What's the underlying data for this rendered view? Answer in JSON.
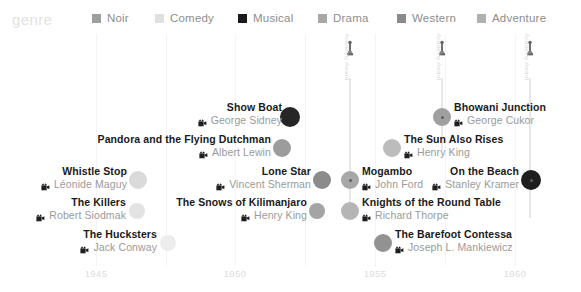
{
  "legend": {
    "title": "genre",
    "items": [
      {
        "label": "Noir",
        "color": "#9e9e9e",
        "x": 92
      },
      {
        "label": "Comedy",
        "color": "#e0e0e0",
        "x": 155
      },
      {
        "label": "Musical",
        "color": "#1a1a1a",
        "x": 238
      },
      {
        "label": "Drama",
        "color": "#a8a8a8",
        "x": 318
      },
      {
        "label": "Western",
        "color": "#8a8a8a",
        "x": 397
      },
      {
        "label": "Adventure",
        "color": "#b0b0b0",
        "x": 477
      }
    ]
  },
  "axis": {
    "ticks": [
      {
        "label": "1945",
        "x": 96
      },
      {
        "label": "1950",
        "x": 235
      },
      {
        "label": "1955",
        "x": 375
      },
      {
        "label": "1960",
        "x": 515
      }
    ],
    "gridlines": [
      96,
      235,
      375,
      515,
      166,
      305,
      445
    ],
    "range": [
      1943,
      1960.5
    ]
  },
  "oscars": [
    {
      "name": "oscar-1953",
      "x": 350,
      "label": "Academy Award",
      "stem_height": 130
    },
    {
      "name": "oscar-1955",
      "x": 442,
      "label": "Academy Award",
      "stem_height": 72
    },
    {
      "name": "oscar-1959",
      "x": 530,
      "label": "Academy Award",
      "stem_height": 140
    }
  ],
  "chart_data": {
    "type": "scatter",
    "title": "",
    "xlabel": "",
    "ylabel": "",
    "xlim": [
      1943,
      1960.5
    ],
    "grid": true,
    "legend_position": "top",
    "legend_title": "genre",
    "categories": [
      "Noir",
      "Comedy",
      "Musical",
      "Drama",
      "Western",
      "Adventure"
    ],
    "points": [
      {
        "title": "Show Boat",
        "director": "George Sidney",
        "genre": "Musical",
        "color": "#262626",
        "x": 290,
        "y": 117,
        "r": 10,
        "align": "right",
        "label_x": 282,
        "label_y": 101,
        "oscar": false
      },
      {
        "title": "Pandora and the Flying Dutchman",
        "director": "Albert Lewin",
        "genre": "Drama",
        "color": "#9c9c9c",
        "x": 282,
        "y": 148,
        "r": 9,
        "align": "right",
        "label_x": 271,
        "label_y": 133,
        "oscar": false
      },
      {
        "title": "Whistle Stop",
        "director": "Léonide Maguy",
        "genre": "Comedy",
        "color": "#dadada",
        "x": 138,
        "y": 180,
        "r": 9,
        "align": "right",
        "label_x": 127,
        "label_y": 165,
        "oscar": false
      },
      {
        "title": "The Killers",
        "director": "Robert Siodmak",
        "genre": "Noir",
        "color": "#e3e3e3",
        "x": 137,
        "y": 211,
        "r": 8,
        "align": "right",
        "label_x": 126,
        "label_y": 196,
        "oscar": false
      },
      {
        "title": "The Hucksters",
        "director": "Jack Conway",
        "genre": "Comedy",
        "color": "#ededed",
        "x": 168,
        "y": 243,
        "r": 8,
        "align": "right",
        "label_x": 157,
        "label_y": 228,
        "oscar": false
      },
      {
        "title": "The Snows of Kilimanjaro",
        "director": "Henry King",
        "genre": "Adventure",
        "color": "#a4a4a4",
        "x": 317,
        "y": 211,
        "r": 8,
        "align": "right",
        "label_x": 307,
        "label_y": 196,
        "oscar": false
      },
      {
        "title": "Lone Star",
        "director": "Vincent Sherman",
        "genre": "Western",
        "color": "#8b8b8b",
        "x": 322,
        "y": 180,
        "r": 9,
        "align": "right",
        "label_x": 311,
        "label_y": 165,
        "oscar": false
      },
      {
        "title": "Mogambo",
        "director": "John Ford",
        "genre": "Drama",
        "color": "#a8a8a8",
        "x": 350,
        "y": 180,
        "r": 9,
        "align": "left",
        "label_x": 362,
        "label_y": 165,
        "oscar": true
      },
      {
        "title": "Knights of the Round Table",
        "director": "Richard Thorpe",
        "genre": "Adventure",
        "color": "#b5b5b5",
        "x": 350,
        "y": 211,
        "r": 9,
        "align": "left",
        "label_x": 362,
        "label_y": 196,
        "oscar": false
      },
      {
        "title": "The Barefoot Contessa",
        "director": "Joseph L. Mankiewicz",
        "genre": "Drama",
        "color": "#929292",
        "x": 383,
        "y": 243,
        "r": 9,
        "align": "left",
        "label_x": 395,
        "label_y": 228,
        "oscar": false
      },
      {
        "title": "Bhowani Junction",
        "director": "George Cukor",
        "genre": "Drama",
        "color": "#a0a0a0",
        "x": 442,
        "y": 117,
        "r": 9,
        "align": "left",
        "label_x": 454,
        "label_y": 101,
        "oscar": true
      },
      {
        "title": "The Sun Also Rises",
        "director": "Henry King",
        "genre": "Adventure",
        "color": "#bcbcbc",
        "x": 392,
        "y": 148,
        "r": 9,
        "align": "left",
        "label_x": 404,
        "label_y": 133,
        "oscar": false
      },
      {
        "title": "On the Beach",
        "director": "Stanley Kramer",
        "genre": "Musical",
        "color": "#1f1f1f",
        "x": 531,
        "y": 180,
        "r": 10,
        "align": "right",
        "label_x": 519,
        "label_y": 165,
        "oscar": true
      }
    ]
  }
}
